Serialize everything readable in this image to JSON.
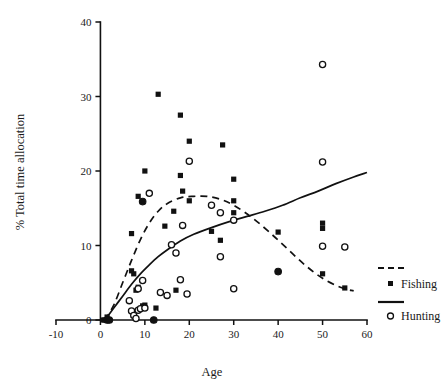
{
  "chart_data": {
    "type": "scatter",
    "title": "",
    "xlabel": "Age",
    "ylabel": "% Total time allocation",
    "xlim": [
      -10,
      60
    ],
    "ylim": [
      0,
      40
    ],
    "xticks": [
      -10,
      0,
      10,
      20,
      30,
      40,
      50,
      60
    ],
    "yticks": [
      0,
      10,
      20,
      30,
      40
    ],
    "xtick_labels": [
      "-10",
      "0",
      "10",
      "20",
      "30",
      "40",
      "50",
      "60"
    ],
    "ytick_labels": [
      "0",
      "10",
      "20",
      "30",
      "40"
    ],
    "grid": false,
    "legend_position": "right",
    "legend": [
      {
        "name": "Fishing",
        "marker": "filled-square",
        "line": "dashed"
      },
      {
        "name": "Hunting",
        "marker": "open-circle",
        "line": "solid"
      }
    ],
    "series": [
      {
        "name": "Fishing",
        "marker": "filled-square",
        "points": [
          [
            1.5,
            0.4
          ],
          [
            2.0,
            0.0
          ],
          [
            0.5,
            0.0
          ],
          [
            1.0,
            0.0
          ],
          [
            7.0,
            6.6
          ],
          [
            7.5,
            6.2
          ],
          [
            7.0,
            11.6
          ],
          [
            8.0,
            4.0
          ],
          [
            8.5,
            4.4
          ],
          [
            9.5,
            1.9
          ],
          [
            10.0,
            2.0
          ],
          [
            8.5,
            16.6
          ],
          [
            10.0,
            20.0
          ],
          [
            12.5,
            1.6
          ],
          [
            13.0,
            30.3
          ],
          [
            14.5,
            12.6
          ],
          [
            16.5,
            14.6
          ],
          [
            17.0,
            4.0
          ],
          [
            18.0,
            19.4
          ],
          [
            18.5,
            17.3
          ],
          [
            18.0,
            27.5
          ],
          [
            20.0,
            24.0
          ],
          [
            20.0,
            16.0
          ],
          [
            25.0,
            11.9
          ],
          [
            27.0,
            10.7
          ],
          [
            27.5,
            23.5
          ],
          [
            30.0,
            18.9
          ],
          [
            30.0,
            16.0
          ],
          [
            30.0,
            14.4
          ],
          [
            40.0,
            11.8
          ],
          [
            50.0,
            13.0
          ],
          [
            50.0,
            12.3
          ],
          [
            50.0,
            6.2
          ],
          [
            55.0,
            4.3
          ]
        ]
      },
      {
        "name": "Hunting",
        "marker": "open-circle",
        "points": [
          [
            6.5,
            2.6
          ],
          [
            7.0,
            1.2
          ],
          [
            7.5,
            0.6
          ],
          [
            8.0,
            0.2
          ],
          [
            8.5,
            1.3
          ],
          [
            8.5,
            4.2
          ],
          [
            9.0,
            1.5
          ],
          [
            9.5,
            5.3
          ],
          [
            10.0,
            1.6
          ],
          [
            11.0,
            17.0
          ],
          [
            13.5,
            3.7
          ],
          [
            15.0,
            3.3
          ],
          [
            16.0,
            10.1
          ],
          [
            17.0,
            9.0
          ],
          [
            18.0,
            5.4
          ],
          [
            18.5,
            12.7
          ],
          [
            19.5,
            3.5
          ],
          [
            20.0,
            21.3
          ],
          [
            25.0,
            15.4
          ],
          [
            27.0,
            14.4
          ],
          [
            27.0,
            8.5
          ],
          [
            30.0,
            13.4
          ],
          [
            30.0,
            4.2
          ],
          [
            50.0,
            34.3
          ],
          [
            50.0,
            21.2
          ],
          [
            50.0,
            9.9
          ],
          [
            55.0,
            9.8
          ]
        ]
      },
      {
        "name": "Overlapping observations",
        "marker": "filled-circle",
        "points": [
          [
            1.5,
            0.0
          ],
          [
            2.0,
            0.0
          ],
          [
            9.5,
            15.9
          ],
          [
            12.0,
            0.0
          ],
          [
            40.0,
            6.5
          ]
        ]
      }
    ],
    "fitted_curves": [
      {
        "name": "Fishing",
        "style": "dashed",
        "description": "Inverted-U curve peaking near age 23 at about 16.6% then declining to about 4% by age 57",
        "points": [
          [
            1.0,
            0.0
          ],
          [
            3.0,
            2.0
          ],
          [
            5.0,
            5.0
          ],
          [
            7.0,
            8.0
          ],
          [
            9.0,
            10.8
          ],
          [
            11.0,
            13.0
          ],
          [
            13.0,
            14.6
          ],
          [
            15.0,
            15.6
          ],
          [
            18.0,
            16.4
          ],
          [
            21.0,
            16.6
          ],
          [
            24.0,
            16.6
          ],
          [
            27.0,
            16.2
          ],
          [
            30.0,
            15.4
          ],
          [
            34.0,
            13.8
          ],
          [
            38.0,
            11.8
          ],
          [
            42.0,
            9.6
          ],
          [
            46.0,
            7.4
          ],
          [
            50.0,
            5.6
          ],
          [
            54.0,
            4.4
          ],
          [
            57.0,
            3.9
          ]
        ]
      },
      {
        "name": "Hunting",
        "style": "solid",
        "description": "Monotonically increasing curve from 0 at age 1 to about 19.7% at age 60",
        "points": [
          [
            1.0,
            0.0
          ],
          [
            3.0,
            1.6
          ],
          [
            5.0,
            3.2
          ],
          [
            7.0,
            4.8
          ],
          [
            9.0,
            6.2
          ],
          [
            11.0,
            7.4
          ],
          [
            13.0,
            8.5
          ],
          [
            15.0,
            9.4
          ],
          [
            18.0,
            10.6
          ],
          [
            21.0,
            11.5
          ],
          [
            25.0,
            12.4
          ],
          [
            29.0,
            13.2
          ],
          [
            33.0,
            13.9
          ],
          [
            37.0,
            14.6
          ],
          [
            41.0,
            15.4
          ],
          [
            45.0,
            16.4
          ],
          [
            49.0,
            17.3
          ],
          [
            53.0,
            18.3
          ],
          [
            57.0,
            19.2
          ],
          [
            60.0,
            19.8
          ]
        ]
      }
    ]
  },
  "axes": {
    "x_title": "Age",
    "y_title": "% Total time allocation"
  }
}
